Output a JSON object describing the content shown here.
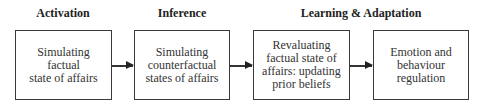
{
  "stages": [
    {
      "label": "Activation"
    },
    {
      "label": "Inference"
    },
    {
      "label": "Learning & Adaptation"
    }
  ],
  "boxes": [
    {
      "lines": [
        "Simulating",
        "factual",
        "state of affairs"
      ]
    },
    {
      "lines": [
        "Simulating",
        "counterfactual",
        "states of affairs"
      ]
    },
    {
      "lines": [
        "Revaluating",
        "factual state of",
        "affairs: updating",
        "prior beliefs"
      ]
    },
    {
      "lines": [
        "Emotion and",
        "behaviour",
        "regulation"
      ]
    }
  ],
  "arrows": [
    {
      "from": 0,
      "to": 1
    },
    {
      "from": 1,
      "to": 2
    },
    {
      "from": 2,
      "to": 3
    }
  ],
  "colors": {
    "border": "#3a3a3a",
    "text": "#333333",
    "background": "#ffffff"
  }
}
